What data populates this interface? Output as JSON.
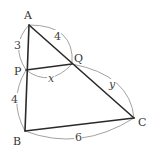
{
  "figure": {
    "vertices": {
      "A": {
        "label": "A",
        "x": 29,
        "y": 25
      },
      "P": {
        "label": "P",
        "x": 26,
        "y": 70
      },
      "Q": {
        "label": "Q",
        "x": 72,
        "y": 64
      },
      "B": {
        "label": "B",
        "x": 25,
        "y": 131
      },
      "C": {
        "label": "C",
        "x": 134,
        "y": 118
      }
    },
    "segments": [
      {
        "from": "A",
        "to": "B"
      },
      {
        "from": "A",
        "to": "C"
      },
      {
        "from": "B",
        "to": "C"
      },
      {
        "from": "P",
        "to": "Q"
      }
    ],
    "measures": {
      "AP": "3",
      "PB": "4",
      "AQ": "4",
      "PQ": "x",
      "QC": "y",
      "BC": "6"
    }
  }
}
